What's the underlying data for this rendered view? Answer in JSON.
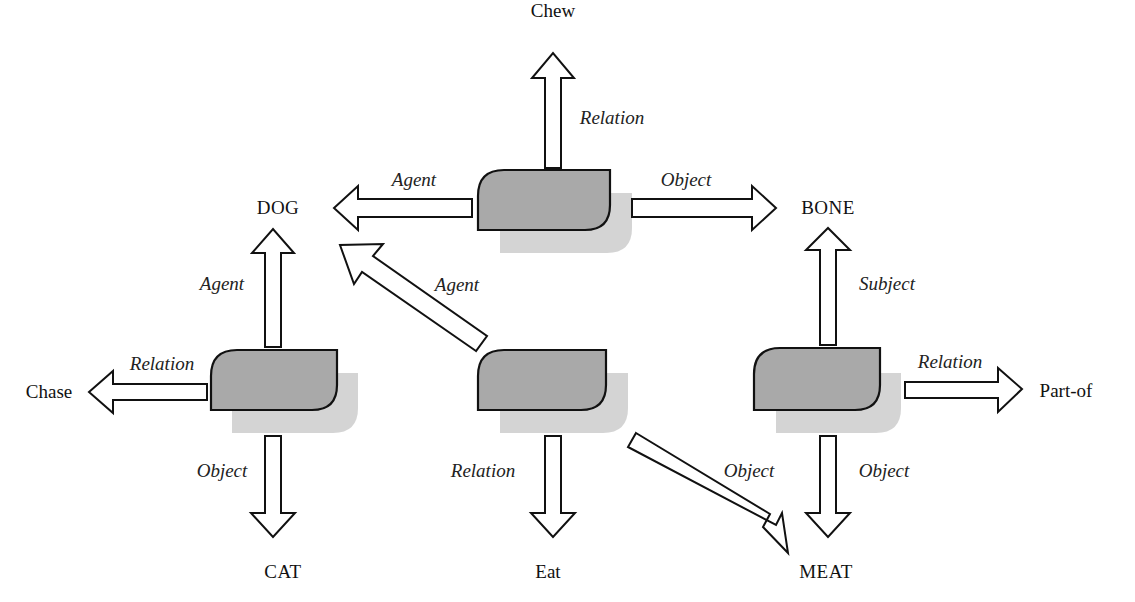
{
  "diagram": {
    "type": "semantic-network",
    "colors": {
      "node_fill": "#a9a9a9",
      "node_shadow": "#d4d4d4",
      "stroke": "#111111",
      "background": "#ffffff"
    },
    "concepts": {
      "chew": "Chew",
      "dog": "DOG",
      "bone": "BONE",
      "chase": "Chase",
      "part_of": "Part-of",
      "cat": "CAT",
      "eat": "Eat",
      "meat": "MEAT"
    },
    "nodes": [
      {
        "id": "node-chew",
        "edges": [
          {
            "label": "Relation",
            "target": "Chew"
          },
          {
            "label": "Agent",
            "target": "DOG"
          },
          {
            "label": "Object",
            "target": "BONE"
          }
        ]
      },
      {
        "id": "node-chase",
        "edges": [
          {
            "label": "Agent",
            "target": "DOG"
          },
          {
            "label": "Relation",
            "target": "Chase"
          },
          {
            "label": "Object",
            "target": "CAT"
          }
        ]
      },
      {
        "id": "node-eat",
        "edges": [
          {
            "label": "Agent",
            "target": "DOG"
          },
          {
            "label": "Relation",
            "target": "Eat"
          },
          {
            "label": "Object",
            "target": "MEAT"
          }
        ]
      },
      {
        "id": "node-part-of",
        "edges": [
          {
            "label": "Subject",
            "target": "BONE"
          },
          {
            "label": "Relation",
            "target": "Part-of"
          },
          {
            "label": "Object",
            "target": "MEAT"
          }
        ]
      }
    ],
    "edge_labels": {
      "chew_relation": "Relation",
      "chew_agent": "Agent",
      "chew_object": "Object",
      "chase_agent": "Agent",
      "chase_relation": "Relation",
      "chase_object": "Object",
      "eat_agent": "Agent",
      "eat_relation": "Relation",
      "eat_object": "Object",
      "partof_subject": "Subject",
      "partof_relation": "Relation",
      "partof_object": "Object"
    }
  }
}
